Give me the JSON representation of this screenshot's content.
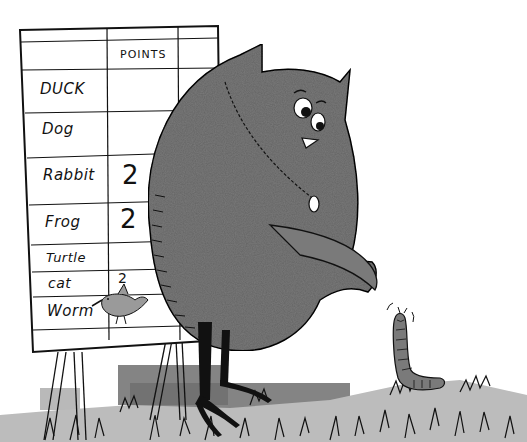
{
  "illustration": {
    "description": "Owl in a vest standing beside a hand-drawn score chart, pointing at a worm in the grass",
    "chart": {
      "header": "POINTS",
      "rows": [
        {
          "animal": "DUCK",
          "points": ""
        },
        {
          "animal": "Dog",
          "points": ""
        },
        {
          "animal": "Rabbit",
          "points": "2"
        },
        {
          "animal": "Frog",
          "points": "2"
        },
        {
          "animal": "Turtle",
          "points": ""
        },
        {
          "animal": "cat",
          "points": "2"
        },
        {
          "animal": "Worm",
          "points": ""
        }
      ]
    },
    "colors": {
      "ink": "#111111",
      "owl_gray": "#7a7a7a",
      "grass_gray": "#b5b5b5",
      "shadow_gray": "#6e6e6e",
      "paper": "#ffffff"
    }
  }
}
